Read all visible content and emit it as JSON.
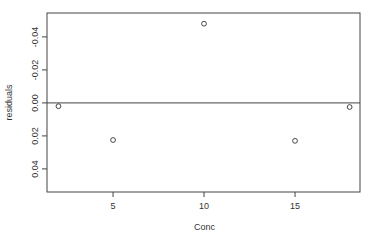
{
  "chart_data": {
    "type": "scatter",
    "title": "",
    "xlabel": "Conc",
    "ylabel": "residuals",
    "x": [
      2,
      5,
      10,
      15,
      18
    ],
    "y": [
      0.002,
      0.0225,
      -0.048,
      0.023,
      0.0025
    ],
    "xlim": [
      1.37,
      18.57
    ],
    "ylim": [
      0.054,
      -0.0545
    ],
    "y_axis_inverted": true,
    "x_ticks": [
      5,
      10,
      15
    ],
    "x_tick_labels": [
      "5",
      "10",
      "15"
    ],
    "y_ticks": [
      -0.04,
      -0.02,
      0.0,
      0.02,
      0.04
    ],
    "y_tick_labels": [
      "-0.04",
      "-0.02",
      "0.00",
      "0.02",
      "0.04"
    ],
    "reference_line": {
      "y": 0.0,
      "orientation": "horizontal"
    },
    "grid": false,
    "legend": null,
    "marker": "open-circle",
    "colors": {
      "points": "#333333",
      "axes": "#444444",
      "background": "#ffffff"
    }
  },
  "plot": {
    "left": 47,
    "right": 360,
    "top": 13,
    "bottom": 192
  }
}
